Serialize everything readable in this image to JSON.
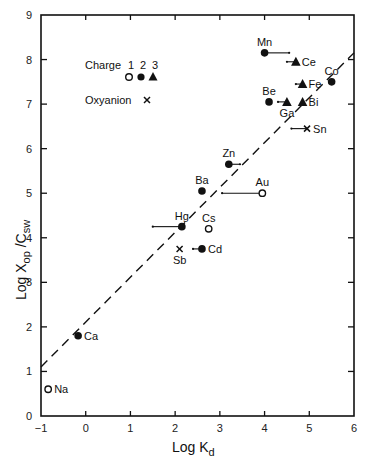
{
  "chart_data": {
    "type": "scatter",
    "title": "",
    "xlabel": "Log K",
    "xlabel_sub": "d",
    "ylabel": "Log X",
    "ylabel_sub1": "op",
    "ylabel_mid": " /C",
    "ylabel_sub2": "sw",
    "xlim": [
      -1,
      6
    ],
    "ylim": [
      0,
      9
    ],
    "xticks": [
      -1,
      0,
      1,
      2,
      3,
      4,
      5,
      6
    ],
    "yticks": [
      0,
      1,
      2,
      3,
      4,
      5,
      6,
      7,
      8,
      9
    ],
    "grid": false,
    "legend": {
      "position": "upper-left",
      "charge_label": "Charge",
      "charge_values": [
        "1",
        "2",
        "3"
      ],
      "charge_markers": [
        "open-circle",
        "filled-circle",
        "filled-triangle"
      ],
      "oxyanion_label": "Oxyanion",
      "oxyanion_marker": "cross"
    },
    "trend_line": {
      "style": "dashed",
      "x": [
        -1,
        6
      ],
      "y": [
        1.1,
        8.15
      ]
    },
    "points": [
      {
        "element": "Na",
        "x": -0.84,
        "y": 0.6,
        "marker": "open-circle",
        "label_pos": "right"
      },
      {
        "element": "Ca",
        "x": -0.17,
        "y": 1.8,
        "marker": "filled-circle",
        "label_pos": "right"
      },
      {
        "element": "Mn",
        "x": 4.0,
        "y": 8.15,
        "marker": "filled-circle",
        "label_pos": "above",
        "range_to": 4.55
      },
      {
        "element": "Ce",
        "x": 4.7,
        "y": 7.95,
        "marker": "filled-triangle",
        "label_pos": "right",
        "range_to": 4.5
      },
      {
        "element": "Co",
        "x": 5.5,
        "y": 7.5,
        "marker": "filled-circle",
        "label_pos": "above"
      },
      {
        "element": "Fe",
        "x": 4.85,
        "y": 7.45,
        "marker": "filled-triangle",
        "label_pos": "right",
        "range_to": 4.7
      },
      {
        "element": "Be",
        "x": 4.1,
        "y": 7.05,
        "marker": "filled-circle",
        "label_pos": "above"
      },
      {
        "element": "Ga",
        "x": 4.5,
        "y": 7.05,
        "marker": "filled-triangle",
        "label_pos": "below",
        "range_to": 4.3
      },
      {
        "element": "Bi",
        "x": 4.85,
        "y": 7.05,
        "marker": "filled-triangle",
        "label_pos": "right"
      },
      {
        "element": "Sn",
        "x": 4.95,
        "y": 6.45,
        "marker": "cross",
        "label_pos": "right",
        "range_to": 4.6
      },
      {
        "element": "Zn",
        "x": 3.2,
        "y": 5.65,
        "marker": "filled-circle",
        "label_pos": "above",
        "range_to": 3.45
      },
      {
        "element": "Ba",
        "x": 2.6,
        "y": 5.05,
        "marker": "filled-circle",
        "label_pos": "above"
      },
      {
        "element": "Au",
        "x": 3.95,
        "y": 5.0,
        "marker": "open-circle",
        "label_pos": "above",
        "range_to": 3.05
      },
      {
        "element": "Hg",
        "x": 2.15,
        "y": 4.25,
        "marker": "filled-circle",
        "label_pos": "above",
        "range_to": 1.5
      },
      {
        "element": "Cs",
        "x": 2.75,
        "y": 4.2,
        "marker": "open-circle",
        "label_pos": "above"
      },
      {
        "element": "Sb",
        "x": 2.1,
        "y": 3.75,
        "marker": "cross",
        "label_pos": "below"
      },
      {
        "element": "Cd",
        "x": 2.6,
        "y": 3.75,
        "marker": "filled-circle",
        "label_pos": "right",
        "range_to": 2.4
      }
    ]
  },
  "colors": {
    "ink": "#111111",
    "background": "#ffffff"
  }
}
